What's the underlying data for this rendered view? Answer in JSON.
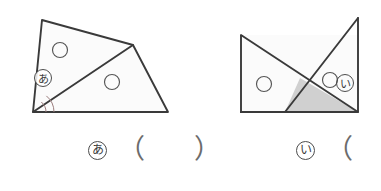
{
  "page": {
    "background_color": "#ffffff",
    "stroke_color": "#3a3a3a",
    "fill_color": "#fbfbfb",
    "shaded_fill_color": "#d0d0d0",
    "arc_color": "#8a6a6a"
  },
  "figures": [
    {
      "id": "figure-left",
      "name": "quadrilateral-split-by-diagonal",
      "outline_points": "42,20 133,45 168,112 33,112",
      "diagonal": {
        "x1": 33,
        "y1": 112,
        "x2": 133,
        "y2": 45
      },
      "marked_circles": [
        {
          "cx": 60,
          "cy": 50,
          "r": 7.5
        },
        {
          "cx": 112,
          "cy": 82,
          "r": 7.5
        }
      ],
      "angle_arcs": [
        {
          "cx": 33,
          "cy": 112,
          "r": 21
        },
        {
          "cx": 33,
          "cy": 112,
          "r": 13
        }
      ],
      "angle_label": "あ"
    },
    {
      "id": "figure-right",
      "name": "rectangle-with-crossing-triangles",
      "rectangle_points": "241,35 357,35 357,112 241,112",
      "left_triangle_points": "241,35 357,112 241,112",
      "right_triangle_points": "358,18 358,112 285,112",
      "shaded_triangle_points": "300,78 358,112 285,112",
      "marked_circles": [
        {
          "cx": 264,
          "cy": 84,
          "r": 7.5
        },
        {
          "cx": 330,
          "cy": 80,
          "r": 7.5
        }
      ],
      "angle_label": "い"
    }
  ],
  "answers": {
    "left": {
      "label": "あ",
      "open_paren": "（",
      "value": "",
      "close_paren": "）"
    },
    "right": {
      "label": "い",
      "open_paren": "（",
      "value": ""
    }
  }
}
